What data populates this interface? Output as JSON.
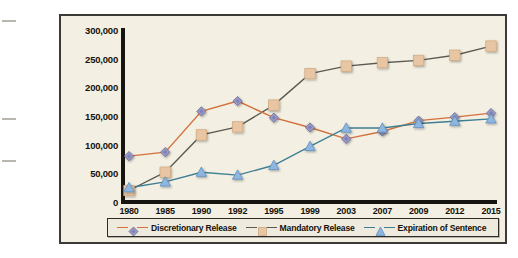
{
  "chart_data": {
    "type": "line",
    "title": "",
    "xlabel": "",
    "ylabel": "",
    "categories": [
      "1980",
      "1985",
      "1990",
      "1992",
      "1995",
      "1999",
      "2003",
      "2007",
      "2009",
      "2012",
      "2015"
    ],
    "ylim": [
      0,
      300000
    ],
    "ytick_labels": [
      "300,000",
      "250,000",
      "200,000",
      "150,000",
      "100,000",
      "50,000",
      "0"
    ],
    "ytick_values": [
      300000,
      250000,
      200000,
      150000,
      100000,
      50000,
      0
    ],
    "grid": false,
    "legend_position": "bottom",
    "series": [
      {
        "name": "Discretionary Release",
        "color": "#d4703c",
        "marker": "diamond",
        "marker_color": "#9a9bc4",
        "values": [
          80000,
          87000,
          158000,
          176000,
          147000,
          130000,
          110000,
          123000,
          142000,
          148000,
          155000
        ]
      },
      {
        "name": "Mandatory Release",
        "color": "#5c5a52",
        "marker": "square",
        "marker_color": "#e8c6a4",
        "values": [
          20000,
          52000,
          117000,
          131000,
          169000,
          224000,
          237000,
          243000,
          247000,
          256000,
          272000
        ]
      },
      {
        "name": "Expiration of Sentence",
        "color": "#3e7f93",
        "marker": "triangle",
        "marker_color": "#8fb6df",
        "values": [
          25000,
          35000,
          52000,
          47000,
          64000,
          97000,
          129000,
          129000,
          137000,
          141000,
          145000
        ]
      }
    ]
  },
  "legend": {
    "items": [
      {
        "label": "Discretionary Release"
      },
      {
        "label": "Mandatory Release"
      },
      {
        "label": "Expiration of Sentence"
      }
    ]
  }
}
